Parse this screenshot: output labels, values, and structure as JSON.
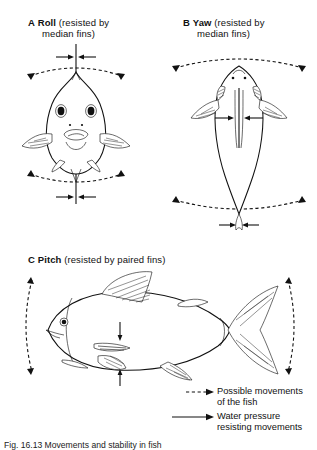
{
  "figure": {
    "caption": "Fig. 16.13   Movements and stability in fish",
    "panels": [
      {
        "letter": "A",
        "term": "Roll",
        "qualifier": "(resisted by",
        "qualifier2": "median fins)",
        "view": "anterior-head-on-view",
        "axis_arrows": "opposed-horizontal-arrows-on-vertical-midline",
        "motion_arcs": "dashed-arcs-above-and-below"
      },
      {
        "letter": "B",
        "term": "Yaw",
        "qualifier": "(resisted by",
        "qualifier2": "median fins)",
        "view": "dorsal-view",
        "axis_arrows": "opposed-horizontal-arrows-on-vertical-midline",
        "motion_arcs": "dashed-arcs-above-and-below"
      },
      {
        "letter": "C",
        "term": "Pitch",
        "qualifier": "(resisted by paired fins)",
        "qualifier2": "",
        "view": "lateral-view",
        "axis_arrows": "opposed-vertical-arrows-at-paired-fins",
        "motion_arcs": "dashed-arcs-left-and-right"
      }
    ]
  },
  "legend": {
    "items": [
      {
        "style": "dashed-arrow",
        "line1": "Possible movements",
        "line2": "of the fish"
      },
      {
        "style": "solid-arrow",
        "line1": "Water pressure",
        "line2": "resisting movements"
      }
    ]
  },
  "colors": {
    "ink": "#111111",
    "background": "#ffffff"
  }
}
